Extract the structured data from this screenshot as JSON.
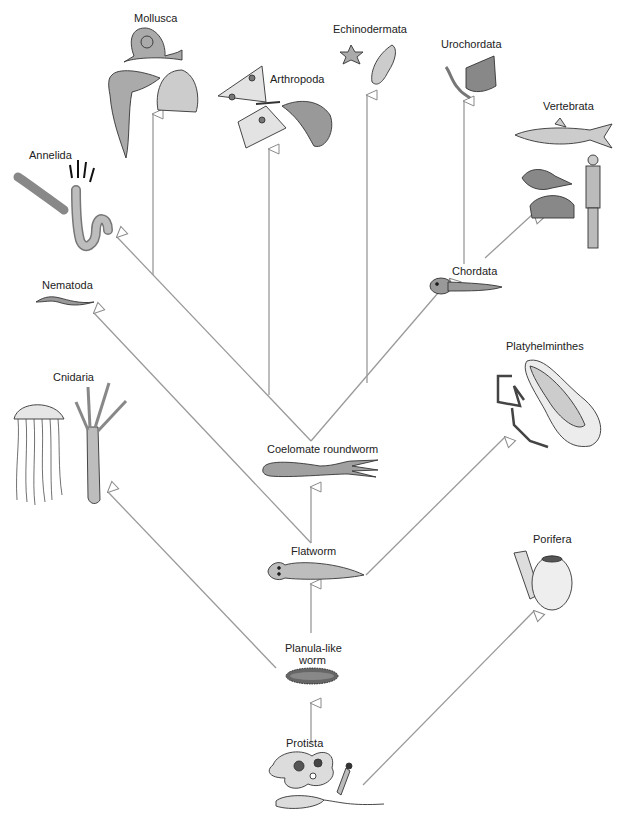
{
  "diagram": {
    "type": "phylogenetic-tree",
    "line_color": "#9a9a9a",
    "organism_fill": "#a8a8a8",
    "nodes": [
      {
        "id": "protista",
        "label": "Protista",
        "x": 312,
        "y": 744
      },
      {
        "id": "planula",
        "label": "Planula-like",
        "label2": "worm",
        "x": 312,
        "y": 647
      },
      {
        "id": "flatworm",
        "label": "Flatworm",
        "x": 312,
        "y": 552
      },
      {
        "id": "coelomate",
        "label": "Coelomate roundworm",
        "x": 312,
        "y": 448
      },
      {
        "id": "chordata",
        "label": "Chordata",
        "x": 463,
        "y": 271
      },
      {
        "id": "porifera",
        "label": "Porifera",
        "x": 550,
        "y": 538
      },
      {
        "id": "platyhelminthes",
        "label": "Platyhelminthes",
        "x": 540,
        "y": 345
      },
      {
        "id": "cnidaria",
        "label": "Cnidaria",
        "x": 72,
        "y": 376
      },
      {
        "id": "nematoda",
        "label": "Nematoda",
        "x": 63,
        "y": 284
      },
      {
        "id": "annelida",
        "label": "Annelida",
        "x": 46,
        "y": 154
      },
      {
        "id": "mollusca",
        "label": "Mollusca",
        "x": 155,
        "y": 17
      },
      {
        "id": "arthropoda",
        "label": "Arthropoda",
        "x": 292,
        "y": 78
      },
      {
        "id": "echinodermata",
        "label": "Echinodermata",
        "x": 359,
        "y": 28
      },
      {
        "id": "urochordata",
        "label": "Urochordata",
        "x": 468,
        "y": 43
      },
      {
        "id": "vertebrata",
        "label": "Vertebrata",
        "x": 568,
        "y": 105
      }
    ],
    "edges": [
      {
        "from": "protista",
        "to": "planula"
      },
      {
        "from": "planula",
        "to": "flatworm"
      },
      {
        "from": "planula",
        "to": "cnidaria"
      },
      {
        "from": "protista",
        "to": "porifera"
      },
      {
        "from": "flatworm",
        "to": "platyhelminthes"
      },
      {
        "from": "flatworm",
        "to": "coelomate"
      },
      {
        "from": "flatworm",
        "to": "nematoda"
      },
      {
        "from": "coelomate",
        "to": "annelida"
      },
      {
        "from": "coelomate",
        "to": "mollusca"
      },
      {
        "from": "coelomate",
        "to": "arthropoda"
      },
      {
        "from": "coelomate",
        "to": "echinodermata"
      },
      {
        "from": "coelomate",
        "to": "chordata"
      },
      {
        "from": "chordata",
        "to": "urochordata"
      },
      {
        "from": "chordata",
        "to": "vertebrata"
      }
    ]
  }
}
